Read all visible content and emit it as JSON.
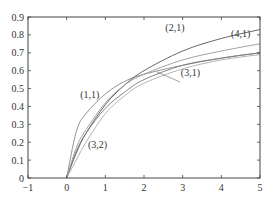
{
  "chart_data": {
    "type": "line",
    "title": "",
    "xlabel": "",
    "ylabel": "",
    "xlim": [
      -1,
      5
    ],
    "ylim": [
      0,
      0.9
    ],
    "grid": false,
    "x_ticks": [
      "-1",
      "0",
      "1",
      "2",
      "3",
      "4",
      "5"
    ],
    "y_ticks": [
      "0",
      "0.1",
      "0.2",
      "0.3",
      "0.4",
      "0.5",
      "0.6",
      "0.7",
      "0.8",
      "0.9"
    ],
    "x": [
      0,
      0.25,
      0.5,
      1,
      1.5,
      2,
      3,
      4,
      5
    ],
    "series": [
      {
        "name": "(1,1)",
        "values": [
          0,
          0.26,
          0.36,
          0.47,
          0.54,
          0.58,
          0.63,
          0.67,
          0.7
        ]
      },
      {
        "name": "(2,1)",
        "values": [
          0,
          0.14,
          0.25,
          0.41,
          0.52,
          0.6,
          0.71,
          0.78,
          0.83
        ]
      },
      {
        "name": "(3,1)",
        "values": [
          0,
          0.15,
          0.25,
          0.39,
          0.48,
          0.55,
          0.63,
          0.67,
          0.7
        ]
      },
      {
        "name": "(4,1)",
        "values": [
          0,
          0.17,
          0.27,
          0.42,
          0.52,
          0.58,
          0.66,
          0.71,
          0.75
        ]
      },
      {
        "name": "(3,2)",
        "values": [
          0,
          0.1,
          0.2,
          0.36,
          0.46,
          0.53,
          0.61,
          0.66,
          0.69
        ]
      }
    ],
    "annotations": [
      {
        "text": "(1,1)",
        "x": 0.6,
        "y": 0.45
      },
      {
        "text": "(2,1)",
        "x": 2.8,
        "y": 0.82
      },
      {
        "text": "(4,1)",
        "x": 4.5,
        "y": 0.79
      },
      {
        "text": "(3,1)",
        "x": 3.2,
        "y": 0.57
      },
      {
        "text": "(3,2)",
        "x": 0.8,
        "y": 0.17
      }
    ],
    "legend": "none (inline labels)"
  }
}
